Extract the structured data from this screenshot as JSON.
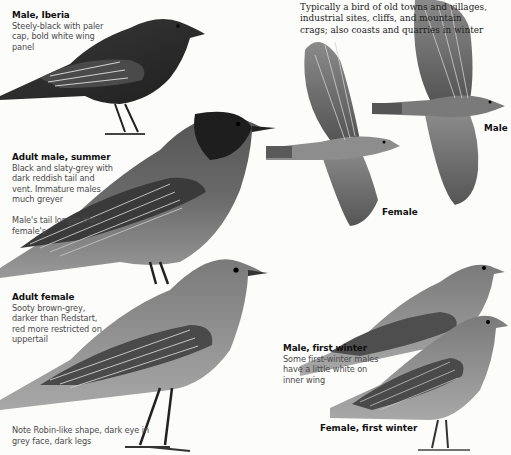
{
  "intro": {
    "text": "Typically a bird of old towns and villages, industrial sites, cliffs, and mountain crags; also coasts and quarries in winter"
  },
  "captions": [
    {
      "id": "male-iberia",
      "title": "Male, Iberia",
      "desc": "Steely-black with paler cap, bold white wing panel"
    },
    {
      "id": "adult-male-summer",
      "title": "Adult male, summer",
      "desc": "Black and slaty-grey with dark reddish tail and vent. Immature males much greyer",
      "note": "Male's tail longer than female's"
    },
    {
      "id": "adult-female",
      "title": "Adult female",
      "desc": "Sooty brown-grey, darker than Redstart, red more restricted on uppertail"
    },
    {
      "id": "male-first-winter",
      "title": "Male, first winter",
      "desc": "Some first-winter males have a little white on inner wing"
    }
  ],
  "notes": {
    "bottom": "Note Robin-like shape, dark eye in grey face, dark legs"
  },
  "labels": {
    "flight_female": "Female",
    "flight_male": "Male",
    "female_first_winter": "Female, first winter"
  },
  "colors": {
    "background": "#fcfcfb",
    "title_text": "#111111",
    "body_text": "#4a4a4a",
    "bird_dark": "#2b2b2b",
    "bird_mid": "#6e6e6e",
    "bird_light": "#a9a9a9"
  }
}
